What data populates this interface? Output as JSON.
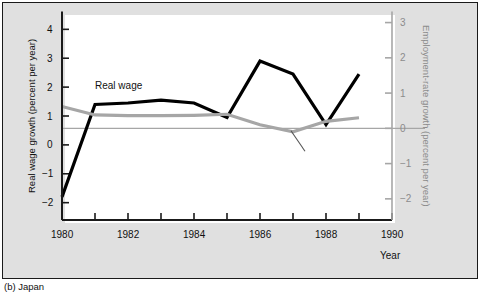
{
  "figure": {
    "caption": "(b)  Japan",
    "background_color": "#e0e0e0",
    "plot_background_color": "#ffffff",
    "border_color": "#1a1a1a"
  },
  "chart_data": {
    "type": "line",
    "title": "",
    "xlabel": "Year",
    "ylabel": "Real wage growth (percent per year)",
    "y2label": "Employment-rate growth (percent per year)",
    "x": [
      1980,
      1981,
      1982,
      1983,
      1984,
      1985,
      1986,
      1987,
      1988,
      1989
    ],
    "xlim": [
      1980,
      1990
    ],
    "ylim": [
      -2.6,
      4.6
    ],
    "y2lim": [
      -2.6,
      3.3
    ],
    "xticks": [
      1980,
      1981,
      1982,
      1983,
      1984,
      1985,
      1986,
      1987,
      1988,
      1989,
      1990
    ],
    "xticklabels": [
      "1980",
      "",
      "1982",
      "",
      "1984",
      "",
      "1986",
      "",
      "1988",
      "",
      "1990"
    ],
    "yticks": [
      -2,
      -1,
      0,
      1,
      2,
      3,
      4
    ],
    "yticklabels": [
      "−2",
      "−1",
      "0",
      "1",
      "2",
      "3",
      "4"
    ],
    "y2ticks": [
      -2,
      -1,
      0,
      1,
      2,
      3
    ],
    "y2ticklabels": [
      "−2",
      "−1",
      "0",
      "1",
      "2",
      "3"
    ],
    "grid": false,
    "legend": "inline-annotation",
    "zero_reference_line": 0,
    "series": [
      {
        "name": "Real wage",
        "axis": "left",
        "color": "#000000",
        "linewidth": 3.2,
        "values": [
          -1.8,
          1.4,
          1.45,
          1.55,
          1.45,
          0.95,
          2.9,
          2.45,
          0.7,
          2.45
        ]
      },
      {
        "name": "Employment-rate growth",
        "axis": "right",
        "color": "#a6a6a6",
        "linewidth": 3.2,
        "values": [
          0.62,
          0.38,
          0.36,
          0.36,
          0.37,
          0.4,
          0.1,
          -0.1,
          0.2,
          0.3
        ]
      }
    ],
    "annotations": [
      {
        "text": "Real wage",
        "x": 1981.0,
        "y": 2.05,
        "color": "#111111"
      },
      {
        "text": "",
        "x": 1987.0,
        "y": -0.35,
        "type": "leader-line",
        "color": "#555555"
      }
    ]
  },
  "axis_labels": {
    "x_axis_name": "Year",
    "left_axis_title": "Real wage growth (percent per year)",
    "right_axis_title": "Employment-rate growth (percent per year)"
  }
}
